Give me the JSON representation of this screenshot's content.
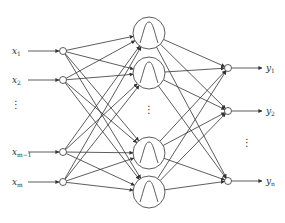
{
  "colors": {
    "stroke": "#333333",
    "background": "#ffffff"
  },
  "inputs": [
    {
      "label": "x",
      "sub": "1",
      "y": 51
    },
    {
      "label": "x",
      "sub": "2",
      "y": 80
    },
    {
      "label": "x",
      "sub": "m−1",
      "y": 152
    },
    {
      "label": "x",
      "sub": "m",
      "y": 182
    }
  ],
  "hidden": [
    {
      "y": 33,
      "icon": "gaussian-bump-icon"
    },
    {
      "y": 73,
      "icon": "gaussian-bump-icon"
    },
    {
      "y": 153,
      "icon": "gaussian-bump-icon"
    },
    {
      "y": 192,
      "icon": "gaussian-bump-icon"
    }
  ],
  "outputs": [
    {
      "label": "y",
      "sub": "1",
      "y": 68
    },
    {
      "label": "y",
      "sub": "2",
      "y": 111
    },
    {
      "label": "y",
      "sub": "n",
      "y": 181
    }
  ],
  "ellipsis": {
    "input": "⋮",
    "hidden": "⋮",
    "output": "⋮"
  }
}
